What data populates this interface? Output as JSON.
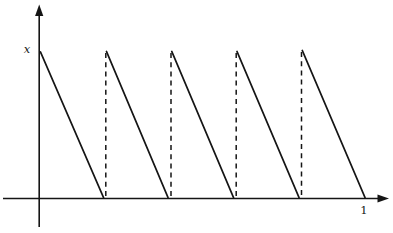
{
  "figure": {
    "background": "#ffffff",
    "stroke": "#151515",
    "width": 393,
    "height": 233,
    "axis": {
      "width": 1.6,
      "x": {
        "x1": 3,
        "x2": 380,
        "y": 198.5,
        "arrow": "389,198.5 377.5,194.4 377.5,202.6"
      },
      "y": {
        "x": 39.2,
        "y1": 227,
        "y2": 14,
        "arrow": "39.2,4.5 35.1,16 43.3,16"
      }
    },
    "tooth_width": 1.8,
    "teeth": [
      {
        "x1": 40.5,
        "y1": 52,
        "x2": 103.5,
        "y2": 197.5
      },
      {
        "x1": 106.5,
        "y1": 51.5,
        "x2": 168,
        "y2": 197.5
      },
      {
        "x1": 171.8,
        "y1": 51.5,
        "x2": 233.5,
        "y2": 197.5
      },
      {
        "x1": 237,
        "y1": 51.5,
        "x2": 299,
        "y2": 197.5
      },
      {
        "x1": 302.3,
        "y1": 50.5,
        "x2": 365,
        "y2": 197.5
      }
    ],
    "dash_width": 1.5,
    "dash_pattern": "5,4.2",
    "dashes": [
      {
        "x": 105.8,
        "y1": 53,
        "y2": 197
      },
      {
        "x": 171,
        "y1": 53,
        "y2": 197
      },
      {
        "x": 236.2,
        "y1": 53,
        "y2": 197
      },
      {
        "x": 301.5,
        "y1": 52,
        "y2": 197
      }
    ],
    "labels": {
      "peak": {
        "text": "x",
        "x": 27,
        "y": 52.5
      },
      "one": {
        "text": "1",
        "x": 364,
        "y": 214
      }
    }
  },
  "chart_data": {
    "type": "line",
    "title": "",
    "xlabel": "",
    "ylabel": "x",
    "x_range": [
      0,
      1
    ],
    "x_tick_labels": [
      "1"
    ],
    "y_axis_label_at_peak": "x",
    "periods": 5,
    "series": [
      {
        "name": "sawtooth",
        "segments": [
          {
            "from": [
              0.0,
              1
            ],
            "to": [
              0.2,
              0
            ]
          },
          {
            "from": [
              0.2,
              1
            ],
            "to": [
              0.4,
              0
            ]
          },
          {
            "from": [
              0.4,
              1
            ],
            "to": [
              0.6,
              0
            ]
          },
          {
            "from": [
              0.6,
              1
            ],
            "to": [
              0.8,
              0
            ]
          },
          {
            "from": [
              0.8,
              1
            ],
            "to": [
              1.0,
              0
            ]
          }
        ]
      }
    ],
    "discontinuities_dashed_at_x": [
      0.2,
      0.4,
      0.6,
      0.8
    ],
    "grid": false,
    "legend": false
  }
}
